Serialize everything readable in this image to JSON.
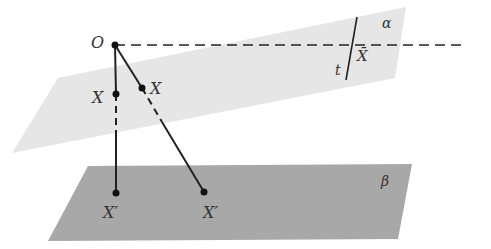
{
  "diagram": {
    "colors": {
      "background": "#ffffff",
      "plane_alpha": "#e6e6e6",
      "plane_beta": "#a8a8a8",
      "lines": "#222222",
      "labels": "#333333"
    },
    "planes": [
      {
        "id": "alpha",
        "label": "α"
      },
      {
        "id": "beta",
        "label": "β"
      }
    ],
    "points": [
      {
        "id": "O",
        "label": "O"
      },
      {
        "id": "X1",
        "label": "X"
      },
      {
        "id": "X2",
        "label": "X"
      },
      {
        "id": "X1p",
        "label": "X′"
      },
      {
        "id": "X2p",
        "label": "X′"
      },
      {
        "id": "Xbar",
        "label": "X̄"
      }
    ],
    "lines": [
      {
        "id": "t",
        "label": "t"
      },
      {
        "id": "horizon",
        "style": "dashed"
      }
    ]
  }
}
